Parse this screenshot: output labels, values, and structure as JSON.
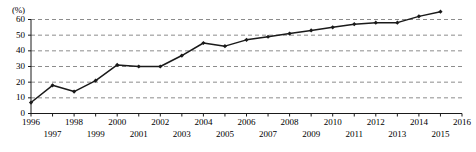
{
  "chart_data": {
    "type": "line",
    "title": "",
    "xlabel": "",
    "ylabel": "(%)",
    "ylim": [
      0,
      60
    ],
    "xlim": [
      1996,
      2016
    ],
    "yticks": [
      0,
      10,
      20,
      30,
      40,
      50,
      60
    ],
    "xticks": [
      1996,
      1997,
      1998,
      1999,
      2000,
      2001,
      2002,
      2003,
      2004,
      2005,
      2006,
      2007,
      2008,
      2009,
      2010,
      2011,
      2012,
      2013,
      2014,
      2015,
      2016
    ],
    "grid": true,
    "grid_style": "dashed-horizontal",
    "legend": "none",
    "marker": "diamond",
    "line_color": "#1a1a1a",
    "grid_color": "#8c8c8c",
    "axis_color": "#1a1a1a",
    "x": [
      1996,
      1997,
      1998,
      1999,
      2000,
      2001,
      2002,
      2003,
      2004,
      2005,
      2006,
      2007,
      2008,
      2009,
      2010,
      2011,
      2012,
      2013,
      2014,
      2015
    ],
    "values": [
      7,
      18,
      14,
      21,
      31,
      30,
      30,
      37,
      45,
      43,
      47,
      49,
      51,
      53,
      55,
      57,
      58,
      58,
      62,
      65
    ],
    "series": [
      {
        "name": "",
        "values": [
          7,
          18,
          14,
          21,
          31,
          30,
          30,
          37,
          45,
          43,
          47,
          49,
          51,
          53,
          55,
          57,
          58,
          58,
          62,
          65
        ]
      }
    ]
  },
  "axis": {
    "y_unit_label": "(%)",
    "y_tick_labels": [
      "60",
      "50",
      "40",
      "30",
      "20",
      "10",
      "0"
    ],
    "x_tick_labels_top_row": [
      "1996",
      "1998",
      "2000",
      "2002",
      "2004",
      "2006",
      "2008",
      "2010",
      "2012",
      "2014",
      "2016"
    ],
    "x_tick_labels_bottom_row": [
      "1997",
      "1999",
      "2001",
      "2003",
      "2005",
      "2007",
      "2009",
      "2011",
      "2013",
      "2015"
    ]
  }
}
